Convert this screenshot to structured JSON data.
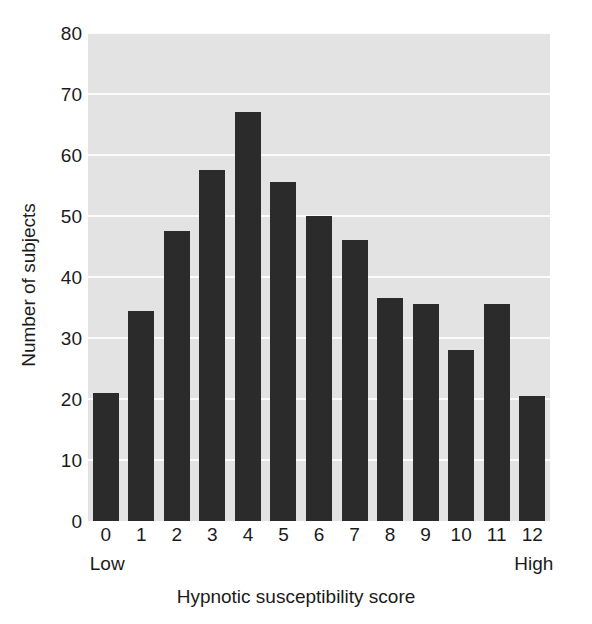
{
  "chart_data": {
    "type": "bar",
    "title": "",
    "xlabel": "Hypnotic susceptibility score",
    "ylabel": "Number of subjects",
    "categories": [
      "0",
      "1",
      "2",
      "3",
      "4",
      "5",
      "6",
      "7",
      "8",
      "9",
      "10",
      "11",
      "12"
    ],
    "values": [
      21,
      34.5,
      47.5,
      57.5,
      67,
      55.5,
      50,
      46,
      36.5,
      35.5,
      28,
      35.5,
      20.5
    ],
    "ylim": [
      0,
      80
    ],
    "yticks": [
      0,
      10,
      20,
      30,
      40,
      50,
      60,
      70,
      80
    ],
    "ytick_labels": [
      "0",
      "10",
      "20",
      "30",
      "40",
      "50",
      "60",
      "70",
      "80"
    ],
    "grid": true,
    "grid_axis": "y",
    "legend": false,
    "bar_color": "#2b2b2b",
    "plot_background": "#e3e3e3",
    "gridline_color": "#fbfbfb",
    "endpoint_labels": {
      "low": "Low",
      "high": "High"
    }
  }
}
